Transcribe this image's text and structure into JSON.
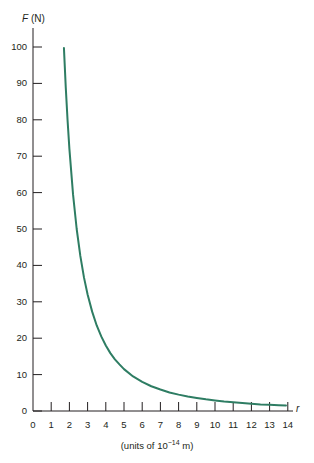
{
  "chart_data": {
    "type": "line",
    "title": "",
    "subtitle": "",
    "xlabel": "r",
    "xlabel_caption": "(units of 10−14 m)",
    "ylabel": "F (N)",
    "ylabel_symbol": "F",
    "ylabel_unit": "(N)",
    "xlim": [
      0,
      14.6
    ],
    "ylim": [
      0,
      104
    ],
    "grid": false,
    "legend": null,
    "x_ticks": [
      0,
      1,
      2,
      3,
      4,
      5,
      6,
      7,
      8,
      9,
      10,
      11,
      12,
      13,
      14
    ],
    "x_tick_labels": [
      "0",
      "1",
      "2",
      "3",
      "4",
      "5",
      "6",
      "7",
      "8",
      "9",
      "10",
      "11",
      "12",
      "13",
      "14"
    ],
    "y_ticks": [
      0,
      10,
      20,
      30,
      40,
      50,
      60,
      70,
      80,
      90,
      100
    ],
    "y_tick_labels": [
      "0",
      "10",
      "20",
      "30",
      "40",
      "50",
      "60",
      "70",
      "80",
      "90",
      "100"
    ],
    "series": [
      {
        "name": "Coulomb force",
        "color": "#2e7d63",
        "relation": "F = 288 / r^2",
        "constant": 288,
        "x_start": 1.7,
        "x_end": 13.9,
        "x": [
          1.7,
          1.8,
          1.9,
          2.0,
          2.2,
          2.4,
          2.6,
          2.8,
          3.0,
          3.25,
          3.5,
          3.75,
          4.0,
          4.25,
          4.5,
          4.75,
          5.0,
          5.5,
          6.0,
          6.5,
          7.0,
          7.5,
          8.0,
          8.5,
          9.0,
          9.5,
          10.0,
          10.5,
          11.0,
          11.5,
          12.0,
          12.5,
          13.0,
          13.5,
          13.9
        ],
        "y": [
          99.7,
          88.9,
          79.8,
          72.0,
          59.5,
          50.0,
          42.6,
          36.7,
          32.0,
          27.3,
          23.5,
          20.5,
          18.0,
          15.9,
          14.2,
          12.8,
          11.5,
          9.5,
          8.0,
          6.8,
          5.9,
          5.1,
          4.5,
          4.0,
          3.6,
          3.2,
          2.9,
          2.6,
          2.4,
          2.2,
          2.0,
          1.8,
          1.7,
          1.6,
          1.5
        ]
      }
    ]
  },
  "geometry": {
    "origin_x": 33,
    "origin_y": 411,
    "px_per_x_unit": 18.2,
    "px_per_y_unit": 3.64,
    "axis_color": "#231f20",
    "background": "#ffffff"
  }
}
